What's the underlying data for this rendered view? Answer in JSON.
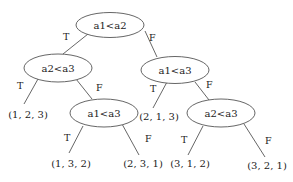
{
  "diagram": {
    "type": "decision-tree",
    "nodes": {
      "root": {
        "label": "a1<a2"
      },
      "left": {
        "label": "a2<a3"
      },
      "right": {
        "label": "a1<a3"
      },
      "left_f": {
        "label": "a1<a3"
      },
      "right_f": {
        "label": "a2<a3"
      }
    },
    "leaves": {
      "l1": "(1, 2, 3)",
      "l2": "(1, 3, 2)",
      "l3": "(2, 3, 1)",
      "l4": "(2, 1, 3)",
      "l5": "(3, 1, 2)",
      "l6": "(3, 2, 1)"
    },
    "edge_labels": {
      "true": "T",
      "false": "F"
    }
  }
}
